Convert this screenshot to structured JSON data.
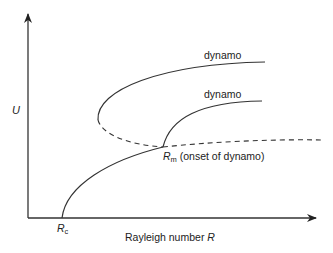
{
  "diagram": {
    "type": "bifurcation-diagram",
    "y_axis_label": "U",
    "x_axis_label": "Rayleigh number",
    "x_axis_symbol": "R",
    "critical_point": {
      "symbol": "R",
      "subscript": "c"
    },
    "onset_point": {
      "symbol": "R",
      "subscript": "m",
      "description": "(onset of dynamo)"
    },
    "branch_labels": [
      "dynamo",
      "dynamo"
    ],
    "colors": {
      "line": "#333333",
      "text": "#222222",
      "background": "#ffffff"
    }
  }
}
